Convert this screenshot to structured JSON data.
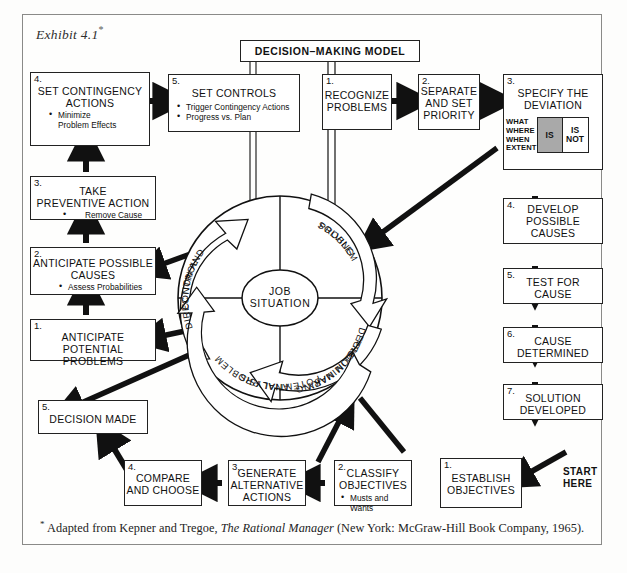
{
  "exhibit": {
    "title": "Exhibit 4.1",
    "star": "*"
  },
  "header": {
    "model_title": "DECISION–MAKING MODEL"
  },
  "start": {
    "line1": "START",
    "line2": "HERE"
  },
  "center": {
    "job_line1": "JOB",
    "job_line2": "SITUATION",
    "quadrants": [
      {
        "name": "direction-and-control",
        "line1": "DIRECTION AND",
        "line2": "CONTROL"
      },
      {
        "name": "problem-solving",
        "line1": "PROBLEM",
        "line2": "SOLVING"
      },
      {
        "name": "preliminary-decision-making",
        "line1": "PRELIMINARY",
        "line2": "DECISION MAKING"
      },
      {
        "name": "potential-problem-analysis",
        "line1": "POTENTIAL PROBLEM",
        "line2": "ANALYSIS"
      }
    ]
  },
  "matrix": {
    "dimensions": [
      "WHAT",
      "WHERE",
      "WHEN",
      "EXTENT"
    ],
    "is_label": "IS",
    "isnot_line1": "IS",
    "isnot_line2": "NOT",
    "is_fill": "#a9a9a9"
  },
  "top_row": {
    "set_contingency": {
      "num": "4.",
      "title_line1": "SET CONTINGENCY",
      "title_line2": "ACTIONS",
      "bullets": [
        "Minimize\nProblem Effects"
      ]
    },
    "set_controls": {
      "num": "5.",
      "title_line1": "SET CONTROLS",
      "bullets": [
        "Trigger Contingency Actions",
        "Progress vs. Plan"
      ]
    },
    "recognize_problems": {
      "num": "1.",
      "title_line1": "RECOGNIZE",
      "title_line2": "PROBLEMS"
    },
    "separate_priority": {
      "num": "2.",
      "title_line1": "SEPARATE",
      "title_line2": "AND SET",
      "title_line3": "PRIORITY"
    },
    "specify_deviation": {
      "num": "3.",
      "title_line1": "SPECIFY THE",
      "title_line2": "DEVIATION"
    }
  },
  "left_column": {
    "take_preventive_action": {
      "num": "3.",
      "title_line1": "TAKE",
      "title_line2": "PREVENTIVE ACTION",
      "bullets": [
        "Remove Cause"
      ]
    },
    "anticipate_possible_causes": {
      "num": "2.",
      "title_line1": "ANTICIPATE POSSIBLE",
      "title_line2": "CAUSES",
      "bullets": [
        "Assess Probabilities"
      ]
    },
    "anticipate_potential_problems": {
      "num": "1.",
      "title_line1": "ANTICIPATE POTENTIAL",
      "title_line2": "PROBLEMS"
    },
    "decision_made": {
      "num": "5.",
      "title_line1": "DECISION MADE"
    }
  },
  "right_column": {
    "develop_possible_causes": {
      "num": "4.",
      "title_line1": "DEVELOP",
      "title_line2": "POSSIBLE",
      "title_line3": "CAUSES"
    },
    "test_for_cause": {
      "num": "5.",
      "title_line1": "TEST FOR",
      "title_line2": "CAUSE"
    },
    "cause_determined": {
      "num": "6.",
      "title_line1": "CAUSE",
      "title_line2": "DETERMINED"
    },
    "solution_developed": {
      "num": "7.",
      "title_line1": "SOLUTION",
      "title_line2": "DEVELOPED"
    }
  },
  "bottom_row": {
    "compare_and_choose": {
      "num": "4.",
      "title_line1": "COMPARE",
      "title_line2": "AND CHOOSE"
    },
    "generate_alternative_actions": {
      "num": "3.",
      "title_line1": "GENERATE",
      "title_line2": "ALTERNATIVE",
      "title_line3": "ACTIONS"
    },
    "classify_objectives": {
      "num": "2.",
      "title_line1": "CLASSIFY",
      "title_line2": "OBJECTIVES",
      "bullets": [
        "Musts and Wants"
      ]
    },
    "establish_objectives": {
      "num": "1.",
      "title_line1": "ESTABLISH",
      "title_line2": "OBJECTIVES"
    }
  },
  "footnote": {
    "star": "*",
    "part1": " Adapted from Kepner and Tregoe, ",
    "italic": "The Rational Manager",
    "part2": " (New York: McGraw-Hill Book Company, 1965)."
  }
}
